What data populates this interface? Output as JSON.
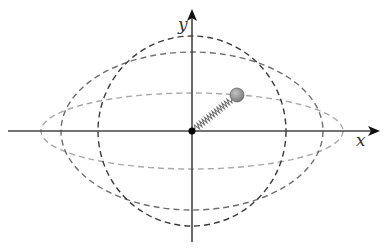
{
  "diagram": {
    "axes": {
      "x_label": "x",
      "y_label": "y"
    },
    "origin": [
      192,
      131
    ],
    "curves": [
      {
        "name": "circle",
        "rx": 94,
        "ry": 95,
        "color": "#3a3a3a"
      },
      {
        "name": "medium-ellipse",
        "rx": 131,
        "ry": 79,
        "color": "#6e6e6e"
      },
      {
        "name": "wide-ellipse",
        "rx": 151,
        "ry": 38,
        "color": "#a8a8a8"
      }
    ],
    "mass": {
      "cx": 237,
      "cy": 95,
      "r": 7,
      "color": "#8c8c8c"
    },
    "spring": {
      "from": [
        192,
        131
      ],
      "to": [
        232,
        99
      ]
    }
  }
}
